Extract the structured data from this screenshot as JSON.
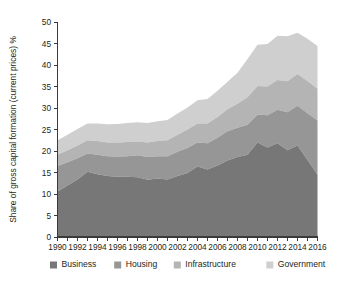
{
  "chart_data": {
    "type": "area",
    "stacked": true,
    "title": "",
    "xlabel": "",
    "ylabel": "Share of gross capital formation (current prices) %",
    "xlim": [
      1990,
      2016
    ],
    "ylim": [
      0,
      50
    ],
    "grid": false,
    "legend_position": "bottom",
    "x": [
      1990,
      1991,
      1992,
      1993,
      1994,
      1995,
      1996,
      1997,
      1998,
      1999,
      2000,
      2001,
      2002,
      2003,
      2004,
      2005,
      2006,
      2007,
      2008,
      2009,
      2010,
      2011,
      2012,
      2013,
      2014,
      2015,
      2016
    ],
    "xticks": [
      1990,
      1992,
      1994,
      1996,
      1998,
      2000,
      2002,
      2004,
      2006,
      2008,
      2010,
      2012,
      2014,
      2016
    ],
    "xtick_labels": [
      "1990",
      "1992",
      "1994",
      "1996",
      "1998",
      "2000",
      "2002",
      "2004",
      "2006",
      "2008",
      "2010",
      "2012",
      "2014",
      "2016"
    ],
    "yticks": [
      0,
      5,
      10,
      15,
      20,
      25,
      30,
      35,
      40,
      45,
      50
    ],
    "ytick_labels": [
      "0",
      "5",
      "10",
      "15",
      "20",
      "25",
      "30",
      "35",
      "40",
      "45",
      "50"
    ],
    "series": [
      {
        "name": "Business",
        "color": "#777777",
        "values": [
          10.6,
          12.0,
          13.4,
          15.2,
          14.6,
          14.2,
          14.0,
          14.0,
          13.9,
          13.3,
          13.6,
          13.4,
          14.2,
          14.9,
          16.4,
          15.7,
          16.6,
          17.8,
          18.6,
          19.1,
          22.0,
          20.8,
          21.8,
          20.2,
          21.3,
          17.9,
          14.5
        ]
      },
      {
        "name": "Housing",
        "color": "#969696",
        "values": [
          5.9,
          5.4,
          4.9,
          4.2,
          4.5,
          4.6,
          4.7,
          4.8,
          5.1,
          5.3,
          5.2,
          5.4,
          5.6,
          5.8,
          5.6,
          6.1,
          6.5,
          6.8,
          6.8,
          7.0,
          6.5,
          7.5,
          7.8,
          8.8,
          9.2,
          10.9,
          12.6
        ]
      },
      {
        "name": "Infrastructure",
        "color": "#b4b4b4",
        "values": [
          2.6,
          2.8,
          3.0,
          3.1,
          3.2,
          3.2,
          3.3,
          3.3,
          3.2,
          3.4,
          3.5,
          3.7,
          4.0,
          4.3,
          4.4,
          4.6,
          4.8,
          5.1,
          5.6,
          6.4,
          6.6,
          6.7,
          6.9,
          7.2,
          7.4,
          7.5,
          7.4
        ]
      },
      {
        "name": "Government",
        "color": "#cfcfcf",
        "values": [
          3.4,
          3.6,
          3.8,
          3.9,
          4.1,
          4.2,
          4.3,
          4.4,
          4.5,
          4.5,
          4.6,
          4.7,
          4.9,
          5.1,
          5.4,
          5.7,
          6.1,
          6.4,
          7.2,
          8.9,
          9.6,
          9.9,
          10.3,
          10.5,
          9.6,
          9.8,
          9.9
        ]
      }
    ],
    "totals": [
      22.5,
      23.8,
      25.1,
      26.4,
      26.4,
      26.2,
      26.3,
      26.5,
      26.7,
      26.5,
      26.9,
      27.2,
      28.7,
      30.1,
      31.8,
      32.1,
      34.0,
      36.1,
      38.2,
      41.4,
      44.7,
      44.9,
      46.8,
      46.7,
      47.5,
      46.1,
      44.4
    ]
  },
  "legend": {
    "items": [
      {
        "label": "Business",
        "color": "#777777"
      },
      {
        "label": "Housing",
        "color": "#969696"
      },
      {
        "label": "Infrastructure",
        "color": "#b4b4b4"
      },
      {
        "label": "Government",
        "color": "#cfcfcf"
      }
    ]
  }
}
